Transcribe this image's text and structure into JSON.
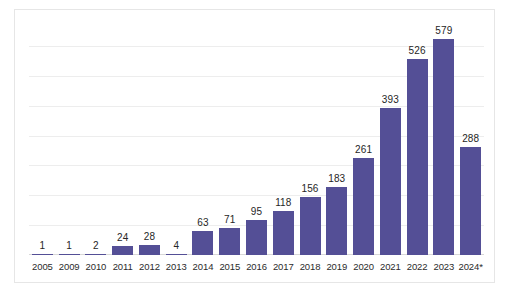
{
  "chart_data": {
    "type": "bar",
    "title": "",
    "subtitle": "",
    "xlabel": "",
    "ylabel": "",
    "categories": [
      "2005",
      "2009",
      "2010",
      "2011",
      "2012",
      "2013",
      "2014",
      "2015",
      "2016",
      "2017",
      "2018",
      "2019",
      "2020",
      "2021",
      "2022",
      "2023",
      "2024*"
    ],
    "values": [
      1,
      1,
      2,
      24,
      28,
      4,
      63,
      71,
      95,
      118,
      156,
      183,
      261,
      393,
      526,
      579,
      288
    ],
    "value_labels": [
      "1",
      "1",
      "2",
      "24",
      "28",
      "4",
      "63",
      "71",
      "95",
      "118",
      "156",
      "183",
      "261",
      "393",
      "526",
      "579",
      "288"
    ],
    "ylim": [
      0,
      640
    ],
    "grid": true,
    "gridline_values": [
      80,
      160,
      240,
      320,
      400,
      480,
      560
    ],
    "legend": null,
    "legend_position": "none",
    "annotations": [
      "2024* denotes a partial or provisional year"
    ],
    "series": [
      {
        "name": "Count",
        "color": "#544f96",
        "values": [
          1,
          1,
          2,
          24,
          28,
          4,
          63,
          71,
          95,
          118,
          156,
          183,
          261,
          393,
          526,
          579,
          288
        ]
      }
    ]
  },
  "style": {
    "bar_color": "#544f96",
    "gridline_color": "#ededed",
    "baseline_color": "#d8d8d8",
    "frame_color": "#e6e6e6",
    "label_color": "#262626",
    "background": "#ffffff"
  }
}
